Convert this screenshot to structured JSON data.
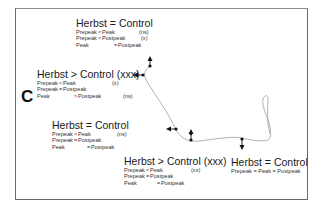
{
  "panel": {
    "label": "C"
  },
  "blocks": [
    {
      "id": "b1",
      "title": "Herbst = Control",
      "rows": [
        {
          "a": "Prepeak",
          "op": "<",
          "b": "Peak",
          "sig": "(ns)"
        },
        {
          "a": "Prepeak",
          "op": "<",
          "b": "Postpeak",
          "sig": "(x)"
        },
        {
          "a": "Peak",
          "op": "=",
          "b": "Postpeak",
          "sig": ""
        }
      ]
    },
    {
      "id": "b2",
      "title": "Herbst > Control (xxx)",
      "rows": [
        {
          "a": "Prepeak",
          "op": "<",
          "b": "Peak",
          "sig": "(x)"
        },
        {
          "a": "Prepeak",
          "op": "=",
          "b": "Postpeak",
          "sig": ""
        },
        {
          "a": "Peak",
          "op": ">",
          "b": "Postpeak",
          "sig": "(ns)"
        }
      ]
    },
    {
      "id": "b3",
      "title": "Herbst = Control",
      "rows": [
        {
          "a": "Prepeak",
          "op": "<",
          "b": "Peak",
          "sig": "(ns)"
        },
        {
          "a": "Prepeak",
          "op": "=",
          "b": "Postpeak",
          "sig": ""
        },
        {
          "a": "Peak",
          "op": "=",
          "b": "Postpeak",
          "sig": ""
        }
      ]
    },
    {
      "id": "b4",
      "title": "Herbst > Control (xxx)",
      "rows": [
        {
          "a": "Prepeak",
          "op": "<",
          "b": "Peak",
          "sig": "(xx)"
        },
        {
          "a": "Prepeak",
          "op": "=",
          "b": "Postpeak",
          "sig": ""
        },
        {
          "a": "Peak",
          "op": "=",
          "b": "Postpeak",
          "sig": ""
        }
      ]
    },
    {
      "id": "b5",
      "title": "Herbst = Control",
      "summary": "Prepeak = Peak = Postpeak"
    }
  ],
  "colors": {
    "frame": "#6a6a6a",
    "curve": "#9a9a9a",
    "marker": "#111111",
    "text": "#1a1a1a"
  }
}
